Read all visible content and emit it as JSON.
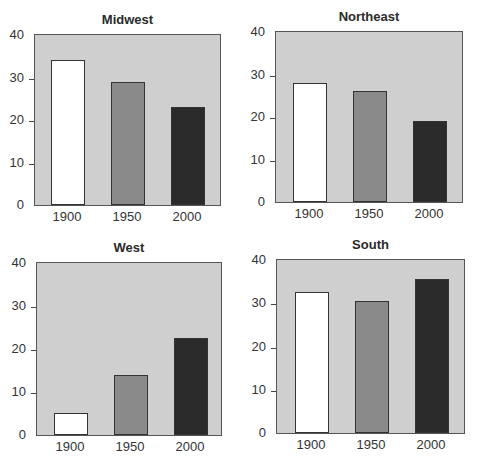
{
  "chart_data": [
    {
      "type": "bar",
      "title": "Midwest",
      "categories": [
        "1900",
        "1950",
        "2000"
      ],
      "values": [
        34,
        29,
        23
      ],
      "colors": [
        "#ffffff",
        "#8a8a8a",
        "#2a2a2a"
      ],
      "ylim": [
        0,
        40
      ],
      "yticks": [
        "0",
        "10",
        "20",
        "30",
        "40"
      ],
      "xlabel": "",
      "ylabel": "",
      "grid": false
    },
    {
      "type": "bar",
      "title": "Northeast",
      "categories": [
        "1900",
        "1950",
        "2000"
      ],
      "values": [
        28,
        26,
        19
      ],
      "colors": [
        "#ffffff",
        "#8a8a8a",
        "#2a2a2a"
      ],
      "ylim": [
        0,
        40
      ],
      "yticks": [
        "0",
        "10",
        "20",
        "30",
        "40"
      ],
      "xlabel": "",
      "ylabel": "",
      "grid": false
    },
    {
      "type": "bar",
      "title": "West",
      "categories": [
        "1900",
        "1950",
        "2000"
      ],
      "values": [
        5,
        14,
        22.5
      ],
      "colors": [
        "#ffffff",
        "#8a8a8a",
        "#2a2a2a"
      ],
      "ylim": [
        0,
        40
      ],
      "yticks": [
        "0",
        "10",
        "20",
        "30",
        "40"
      ],
      "xlabel": "",
      "ylabel": "",
      "grid": false
    },
    {
      "type": "bar",
      "title": "South",
      "categories": [
        "1900",
        "1950",
        "2000"
      ],
      "values": [
        32.5,
        30.5,
        35.5
      ],
      "colors": [
        "#ffffff",
        "#8a8a8a",
        "#2a2a2a"
      ],
      "ylim": [
        0,
        40
      ],
      "yticks": [
        "0",
        "10",
        "20",
        "30",
        "40"
      ],
      "xlabel": "",
      "ylabel": "",
      "grid": false
    }
  ],
  "style": {
    "plot_background": "#cfcfcf",
    "bar_colors": [
      "#ffffff",
      "#8a8a8a",
      "#2a2a2a"
    ]
  }
}
